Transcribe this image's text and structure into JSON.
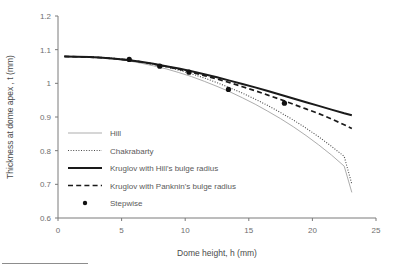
{
  "chart_data": {
    "type": "line",
    "title": "",
    "xlabel": "Dome height, h (mm)",
    "ylabel": "Thickness at dome apex , t (mm)",
    "xlim": [
      0,
      25
    ],
    "ylim": [
      0.6,
      1.2
    ],
    "xticks": [
      0,
      5,
      10,
      15,
      20,
      25
    ],
    "xtick_labels": [
      "0",
      "5",
      "10",
      "15",
      "20",
      "25"
    ],
    "yticks": [
      0.6,
      0.7,
      0.8,
      0.9,
      1.0,
      1.1,
      1.2
    ],
    "ytick_labels": [
      "0.6",
      "0.7",
      "0.8",
      "0.9",
      "1",
      "1.1",
      "1.2"
    ],
    "grid": false,
    "legend_position": "inside-lower-left",
    "series": [
      {
        "name": "Hill",
        "style": "thin-solid-gray",
        "x": [
          0.5,
          1.5,
          2.5,
          3.5,
          4.5,
          5.5,
          6.5,
          7.5,
          8.5,
          9.5,
          10.5,
          11.5,
          12.5,
          13.5,
          14.5,
          15.5,
          16.5,
          17.5,
          18.5,
          19.5,
          20.5,
          21.5,
          22.5,
          23.1
        ],
        "values": [
          1.08,
          1.079,
          1.078,
          1.076,
          1.072,
          1.067,
          1.06,
          1.052,
          1.043,
          1.032,
          1.02,
          1.006,
          0.991,
          0.975,
          0.957,
          0.938,
          0.917,
          0.895,
          0.871,
          0.845,
          0.817,
          0.787,
          0.754,
          0.676
        ]
      },
      {
        "name": "Chakrabarty",
        "style": "dotted",
        "x": [
          0.5,
          1.5,
          2.5,
          3.5,
          4.5,
          5.5,
          6.5,
          7.5,
          8.5,
          9.5,
          10.5,
          11.5,
          12.5,
          13.5,
          14.5,
          15.5,
          16.5,
          17.5,
          18.5,
          19.5,
          20.5,
          21.5,
          22.5,
          23.1
        ],
        "values": [
          1.08,
          1.079,
          1.079,
          1.077,
          1.074,
          1.07,
          1.064,
          1.057,
          1.049,
          1.039,
          1.028,
          1.016,
          1.002,
          0.987,
          0.971,
          0.953,
          0.934,
          0.913,
          0.891,
          0.867,
          0.841,
          0.813,
          0.783,
          0.701
        ]
      },
      {
        "name": "Kruglov with Hill's bulge radius",
        "style": "thick-solid-black",
        "x": [
          0.5,
          1.5,
          2.5,
          3.5,
          4.5,
          5.5,
          6.5,
          7.5,
          8.5,
          9.5,
          10.5,
          11.5,
          12.5,
          13.5,
          14.5,
          15.5,
          16.5,
          17.5,
          18.5,
          19.5,
          20.5,
          21.5,
          22.5,
          23.1
        ],
        "values": [
          1.08,
          1.079,
          1.078,
          1.076,
          1.073,
          1.069,
          1.064,
          1.058,
          1.051,
          1.044,
          1.036,
          1.027,
          1.018,
          1.008,
          0.998,
          0.988,
          0.977,
          0.966,
          0.955,
          0.944,
          0.933,
          0.922,
          0.911,
          0.905
        ]
      },
      {
        "name": "Kruglov with Panknin's bulge radius",
        "style": "dashed-black",
        "x": [
          0.5,
          1.5,
          2.5,
          3.5,
          4.5,
          5.5,
          6.5,
          7.5,
          8.5,
          9.5,
          10.5,
          11.5,
          12.5,
          13.5,
          14.5,
          15.5,
          16.5,
          17.5,
          18.5,
          19.5,
          20.5,
          21.5,
          22.5,
          23.1
        ],
        "values": [
          1.08,
          1.079,
          1.078,
          1.076,
          1.073,
          1.069,
          1.064,
          1.057,
          1.05,
          1.042,
          1.033,
          1.023,
          1.013,
          1.002,
          0.99,
          0.978,
          0.965,
          0.952,
          0.938,
          0.924,
          0.91,
          0.894,
          0.877,
          0.866
        ]
      },
      {
        "name": "Stepwise",
        "style": "filled-circle-markers",
        "x": [
          5.6,
          8.0,
          10.3,
          13.4,
          17.8
        ],
        "values": [
          1.071,
          1.051,
          1.033,
          0.982,
          0.941
        ]
      }
    ],
    "legend_entries": [
      {
        "label": "Hill",
        "style": "thin-solid-gray"
      },
      {
        "label": "Chakrabarty",
        "style": "dotted"
      },
      {
        "label": "Kruglov with Hill's bulge radius",
        "style": "thick-solid-black"
      },
      {
        "label": "Kruglov with Panknin's bulge radius",
        "style": "dashed-black"
      },
      {
        "label": "Stepwise",
        "style": "filled-circle-markers"
      }
    ],
    "colors": {
      "hill": "#adadad",
      "chakrabarty": "#4b4b4b",
      "kruglov_hill": "#1a1a1a",
      "kruglov_panknin": "#1a1a1a",
      "stepwise": "#111111",
      "axis": "#7a7a7a",
      "text": "#5a5a5a",
      "background": "#ffffff"
    }
  }
}
